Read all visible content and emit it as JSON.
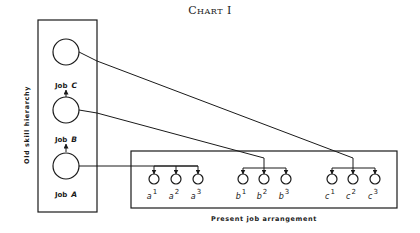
{
  "title": "Chart I",
  "left_panel": {
    "label": "Old skill hierarchy",
    "jobs": [
      {
        "prefix": "Job",
        "letter": "C"
      },
      {
        "prefix": "Job",
        "letter": "B"
      },
      {
        "prefix": "Job",
        "letter": "A"
      }
    ]
  },
  "right_panel": {
    "label": "Present job arrangement",
    "groups": [
      {
        "letter": "a",
        "items": [
          "1",
          "2",
          "3"
        ],
        "source": "A"
      },
      {
        "letter": "b",
        "items": [
          "1",
          "2",
          "3"
        ],
        "source": "B"
      },
      {
        "letter": "c",
        "items": [
          "1",
          "2",
          "3"
        ],
        "source": "C"
      }
    ]
  }
}
